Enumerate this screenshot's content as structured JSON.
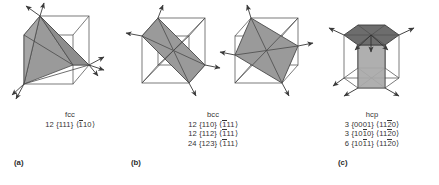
{
  "figure": {
    "background_color": "#ffffff",
    "line_color": "#4a4a4a",
    "plane_fill_mid": "#9a9a9a",
    "plane_fill_dark": "#6d6d6d",
    "plane_fill_light": "#ababab",
    "text_color": "#333333"
  },
  "panels": [
    {
      "id": "a",
      "label": "(a)",
      "structure_icon": "fcc-cube-111-plane",
      "caption": {
        "title": "fcc",
        "rows": [
          {
            "count": "12",
            "plane_open": "{",
            "plane": "111",
            "plane_close": "}",
            "dir_open": "⟨",
            "dir_bar": "1",
            "dir_rest": "10",
            "dir_close": "⟩"
          }
        ]
      }
    },
    {
      "id": "b",
      "label": "(b)",
      "structure_icon": "bcc-cube-110-plane",
      "caption": {
        "title": "bcc",
        "rows": [
          {
            "count": "12",
            "plane_open": "{",
            "plane": "110",
            "plane_close": "}",
            "dir_open": "⟨",
            "dir_bar": "1",
            "dir_rest": "11",
            "dir_close": "⟩"
          },
          {
            "count": "12",
            "plane_open": "{",
            "plane": "112",
            "plane_close": "}",
            "dir_open": "⟨",
            "dir_bar": "1",
            "dir_rest": "11",
            "dir_close": "⟩"
          },
          {
            "count": "24",
            "plane_open": "{",
            "plane": "123",
            "plane_close": "}",
            "dir_open": "⟨",
            "dir_bar": "1",
            "dir_rest": "11",
            "dir_close": "⟩"
          }
        ]
      }
    },
    {
      "id": "c",
      "label": "(c)",
      "structure_icon": "hcp-hexagonal-prism",
      "caption": {
        "title": "hcp",
        "rows": [
          {
            "count": "3",
            "plane_open": "{",
            "plane_pre": "0001",
            "plane_bar": "",
            "plane_post": "",
            "plane_close": "}",
            "dir_open": "⟨",
            "dir_pre": "11",
            "dir_bar": "2",
            "dir_post": "0",
            "dir_close": "⟩"
          },
          {
            "count": "3",
            "plane_open": "{",
            "plane_pre": "10",
            "plane_bar": "1",
            "plane_post": "0",
            "plane_close": "}",
            "dir_open": "⟨",
            "dir_pre": "11",
            "dir_bar": "2",
            "dir_post": "0",
            "dir_close": "⟩"
          },
          {
            "count": "6",
            "plane_open": "{",
            "plane_pre": "10",
            "plane_bar": "1",
            "plane_post": "1",
            "plane_close": "}",
            "dir_open": "⟨",
            "dir_pre": "11",
            "dir_bar": "2",
            "dir_post": "0",
            "dir_close": "⟩"
          }
        ]
      }
    }
  ]
}
